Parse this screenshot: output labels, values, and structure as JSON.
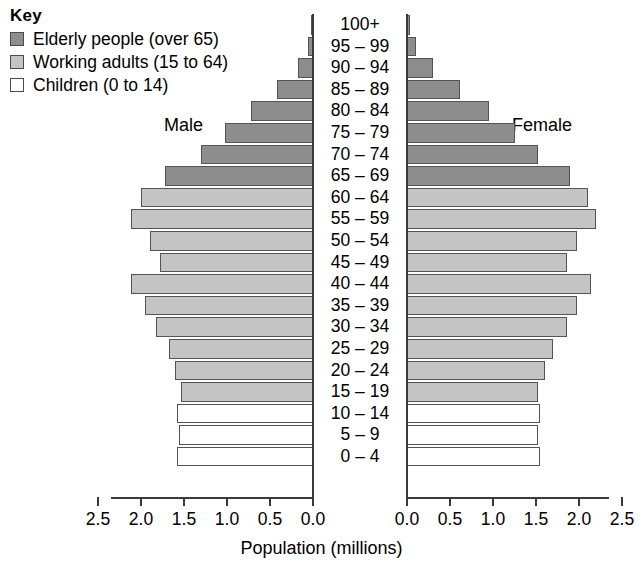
{
  "key": {
    "title": "Key",
    "items": [
      {
        "label": "Elderly people (over 65)",
        "color": "#8d8d8d",
        "group": "elderly"
      },
      {
        "label": "Working adults (15 to 64)",
        "color": "#c4c4c4",
        "group": "working"
      },
      {
        "label": "Children (0 to 14)",
        "color": "#ffffff",
        "group": "children"
      }
    ]
  },
  "labels": {
    "male": "Male",
    "female": "Female"
  },
  "axis": {
    "xlabel": "Population (millions)",
    "tick_labels_left": [
      "2.5",
      "2.0",
      "1.5",
      "1.0",
      "0.5",
      "0.0"
    ],
    "tick_labels_right": [
      "0.0",
      "0.5",
      "1.0",
      "1.5",
      "2.0",
      "2.5"
    ]
  },
  "chart_data": {
    "type": "bar",
    "subtype": "population-pyramid",
    "title": "",
    "xlabel": "Population (millions)",
    "ylabel": "",
    "xlim": [
      0,
      2.5
    ],
    "grid": false,
    "legend_position": "top-left",
    "categories": [
      "100+",
      "95 – 99",
      "90 – 94",
      "85 – 89",
      "80 – 84",
      "75 – 79",
      "70 – 74",
      "65 – 69",
      "60 – 64",
      "55 – 59",
      "50 – 54",
      "45 – 49",
      "40 – 44",
      "35 – 39",
      "30 – 34",
      "25 – 29",
      "20 – 24",
      "15 – 19",
      "10 – 14",
      "5 – 9",
      "0 – 4"
    ],
    "groups": [
      "elderly",
      "elderly",
      "elderly",
      "elderly",
      "elderly",
      "elderly",
      "elderly",
      "elderly",
      "working",
      "working",
      "working",
      "working",
      "working",
      "working",
      "working",
      "working",
      "working",
      "working",
      "children",
      "children",
      "children"
    ],
    "series": [
      {
        "name": "Male",
        "side": "left",
        "values": [
          0.02,
          0.06,
          0.18,
          0.42,
          0.72,
          1.02,
          1.3,
          1.72,
          2.0,
          2.12,
          1.9,
          1.78,
          2.12,
          1.95,
          1.82,
          1.68,
          1.6,
          1.54,
          1.58,
          1.56,
          1.58
        ]
      },
      {
        "name": "Female",
        "side": "right",
        "values": [
          0.03,
          0.1,
          0.3,
          0.62,
          0.95,
          1.25,
          1.52,
          1.9,
          2.1,
          2.2,
          1.98,
          1.86,
          2.14,
          1.98,
          1.86,
          1.7,
          1.6,
          1.52,
          1.55,
          1.52,
          1.55
        ]
      }
    ]
  }
}
